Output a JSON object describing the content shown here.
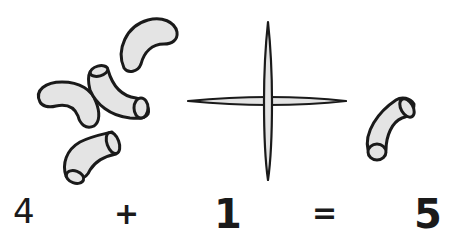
{
  "illustration": {
    "left_group": {
      "label": "macaroni pieces",
      "count": 4
    },
    "operator_symbol": "plus-sign",
    "right_group": {
      "label": "macaroni piece",
      "count": 1
    },
    "colors": {
      "outline": "#1a1a1a",
      "fill": "#e4e4e4",
      "background": "#ffffff"
    }
  },
  "equation": {
    "left": "4",
    "operator": "+",
    "right": "1",
    "equals": "=",
    "result": "5"
  }
}
